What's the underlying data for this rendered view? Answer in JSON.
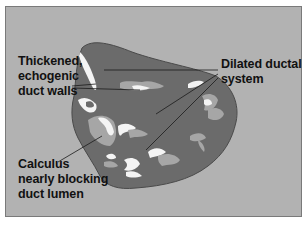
{
  "diagram": {
    "type": "anatomical-illustration",
    "colors": {
      "background": "#b2b2b2",
      "frame_border": "#7a7a7a",
      "organ": "#6b6b6b",
      "organ_outline": "#4a4a4a",
      "echogenic": "#f4f4f4",
      "calculus_fill": "#a6a6a6",
      "leader_line": "#1a1a1a",
      "text": "#111111"
    },
    "labels": [
      {
        "id": "walls",
        "lines": [
          "Thickened,",
          "echogenic",
          "duct walls"
        ]
      },
      {
        "id": "dilated",
        "lines": [
          "Dilated ductal",
          "system"
        ]
      },
      {
        "id": "calculus",
        "lines": [
          "Calculus",
          "nearly blocking",
          "duct lumen"
        ]
      }
    ]
  }
}
